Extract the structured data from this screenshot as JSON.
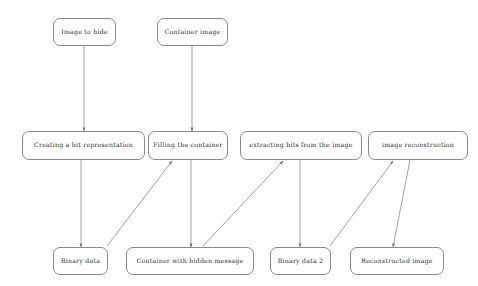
{
  "diagram": {
    "type": "flowchart",
    "title": "",
    "background_color": "#ffffff",
    "node_border_color": "#8a8a8a",
    "edge_color": "#7a7a7a",
    "text_color": "#2a2a2a",
    "nodes": [
      {
        "id": "image_to_hide",
        "label": "Image to hide",
        "x": 53,
        "y": 18,
        "w": 63,
        "h": 28,
        "row": "top"
      },
      {
        "id": "container_image",
        "label": "Container image",
        "x": 157,
        "y": 18,
        "w": 71,
        "h": 28,
        "row": "top"
      },
      {
        "id": "creating_bits",
        "label": "Creating a bit representation",
        "x": 22,
        "y": 131,
        "w": 123,
        "h": 29,
        "row": "middle"
      },
      {
        "id": "filling_container",
        "label": "Filling the container",
        "x": 148,
        "y": 131,
        "w": 80,
        "h": 29,
        "row": "middle"
      },
      {
        "id": "extracting_bits",
        "label": "extracting bits from the image",
        "x": 240,
        "y": 131,
        "w": 122,
        "h": 29,
        "row": "middle"
      },
      {
        "id": "image_recon",
        "label": "image reconstruction",
        "x": 368,
        "y": 131,
        "w": 100,
        "h": 29,
        "row": "middle"
      },
      {
        "id": "binary_data",
        "label": "Binary data",
        "x": 53,
        "y": 247,
        "w": 55,
        "h": 28,
        "row": "bottom"
      },
      {
        "id": "container_hidden",
        "label": "Container with hidden message",
        "x": 126,
        "y": 247,
        "w": 128,
        "h": 28,
        "row": "bottom"
      },
      {
        "id": "binary_data_2",
        "label": "Binary data 2",
        "x": 270,
        "y": 247,
        "w": 61,
        "h": 28,
        "row": "bottom"
      },
      {
        "id": "reconstructed_image",
        "label": "Reconstructed image",
        "x": 350,
        "y": 247,
        "w": 94,
        "h": 28,
        "row": "bottom"
      }
    ],
    "edges": [
      {
        "id": "e1",
        "from": "image_to_hide",
        "to": "creating_bits",
        "x1": 84,
        "y1": 46,
        "x2": 84,
        "y2": 131,
        "arrow": "end"
      },
      {
        "id": "e2",
        "from": "container_image",
        "to": "filling_container",
        "x1": 192,
        "y1": 46,
        "x2": 192,
        "y2": 131,
        "arrow": "end"
      },
      {
        "id": "e3",
        "from": "creating_bits",
        "to": "binary_data",
        "x1": 81,
        "y1": 160,
        "x2": 81,
        "y2": 247,
        "arrow": "end"
      },
      {
        "id": "e4",
        "from": "binary_data",
        "to": "filling_container",
        "x1": 107,
        "y1": 246,
        "x2": 172,
        "y2": 161,
        "arrow": "end"
      },
      {
        "id": "e5",
        "from": "filling_container",
        "to": "container_hidden",
        "x1": 191,
        "y1": 160,
        "x2": 191,
        "y2": 247,
        "arrow": "end"
      },
      {
        "id": "e6",
        "from": "container_hidden",
        "to": "extracting_bits",
        "x1": 203,
        "y1": 246,
        "x2": 283,
        "y2": 161,
        "arrow": "end"
      },
      {
        "id": "e7",
        "from": "extracting_bits",
        "to": "binary_data_2",
        "x1": 300,
        "y1": 160,
        "x2": 300,
        "y2": 247,
        "arrow": "end"
      },
      {
        "id": "e8",
        "from": "binary_data_2",
        "to": "image_recon",
        "x1": 330,
        "y1": 246,
        "x2": 393,
        "y2": 161,
        "arrow": "end"
      },
      {
        "id": "e9",
        "from": "image_recon",
        "to": "reconstructed_image",
        "x1": 410,
        "y1": 160,
        "x2": 393,
        "y2": 247,
        "arrow": "end"
      }
    ]
  }
}
